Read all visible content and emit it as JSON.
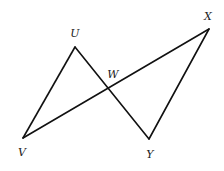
{
  "diagram": {
    "type": "geometry",
    "points": {
      "U": {
        "x": 75,
        "y": 47,
        "label": "U",
        "lx": 75,
        "ly": 37
      },
      "X": {
        "x": 209,
        "y": 29,
        "label": "X",
        "lx": 208,
        "ly": 20
      },
      "V": {
        "x": 23,
        "y": 138,
        "label": "V",
        "lx": 22,
        "ly": 156
      },
      "Y": {
        "x": 149,
        "y": 139,
        "label": "Y",
        "lx": 150,
        "ly": 158
      },
      "W": {
        "x": 108,
        "y": 88,
        "label": "W",
        "lx": 113,
        "ly": 78
      }
    },
    "segments": [
      {
        "from": "V",
        "to": "U"
      },
      {
        "from": "U",
        "to": "Y"
      },
      {
        "from": "Y",
        "to": "X"
      },
      {
        "from": "X",
        "to": "V"
      }
    ],
    "colors": {
      "stroke": "#111111",
      "label": "#222222",
      "background": "#ffffff"
    }
  }
}
